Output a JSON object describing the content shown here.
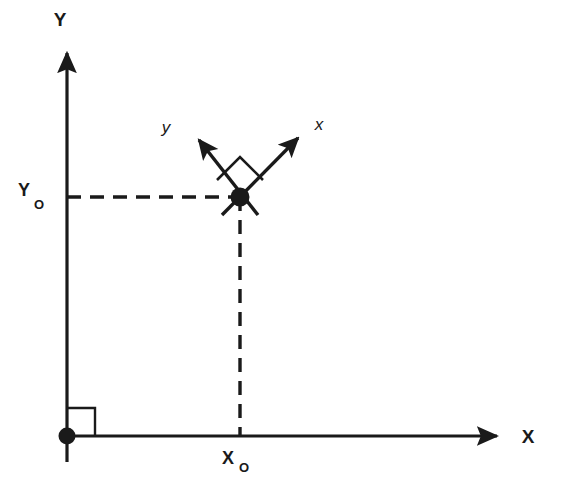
{
  "figure": {
    "background_color": "#ffffff",
    "stroke_color": "#1a1a1a"
  },
  "global_axes": {
    "x_axis": {
      "label": "X",
      "label_x": 528,
      "label_y": 443,
      "line_x1": 67,
      "line_y1": 436,
      "line_x2": 497,
      "line_y2": 436,
      "arrow_tip_x": 508,
      "arrow_tip_y": 436
    },
    "y_axis": {
      "label": "Y",
      "label_x": 60,
      "label_y": 26,
      "line_x1": 67,
      "line_y1": 462,
      "line_x2": 67,
      "line_y2": 53,
      "arrow_tip_x": 67,
      "arrow_tip_y": 41
    },
    "origin": {
      "name": "origin-marker",
      "cx": 67,
      "cy": 436,
      "r": 8
    },
    "right_angle_marker": {
      "name": "origin-right-angle",
      "x": 67,
      "y": 436,
      "size": 28
    }
  },
  "point": {
    "name": "point-P",
    "cx": 240,
    "cy": 197,
    "r": 9
  },
  "coordinate_labels": {
    "x0": {
      "main": "X",
      "sub": "O",
      "main_x": 228,
      "main_y": 464,
      "sub_x": 242,
      "sub_y": 472
    },
    "y0": {
      "main": "Y",
      "sub": "O",
      "main_x": 24,
      "main_y": 196,
      "sub_x": 38,
      "sub_y": 207
    }
  },
  "projection_lines": {
    "horizontal": {
      "x1": 67,
      "y1": 197,
      "x2": 240,
      "y2": 197,
      "dash": "14 9"
    },
    "vertical": {
      "x1": 240,
      "y1": 197,
      "x2": 240,
      "y2": 436,
      "dash": "14 9"
    }
  },
  "local_axes": {
    "x_axis": {
      "label": "x",
      "label_x": 319,
      "label_y": 130,
      "line_x1": 222,
      "line_y1": 215,
      "line_x2": 298,
      "line_y2": 138,
      "arrow_tip_x": 307,
      "arrow_tip_y": 129
    },
    "y_axis": {
      "label": "y",
      "label_x": 166,
      "label_y": 133,
      "line_x1": 258,
      "line_y1": 215,
      "line_x2": 199,
      "line_y2": 140,
      "arrow_tip_x": 190,
      "arrow_tip_y": 130
    },
    "right_angle_marker": {
      "name": "local-axes-right-angle",
      "points": "240,156 264,180 240,204 216,180"
    }
  }
}
